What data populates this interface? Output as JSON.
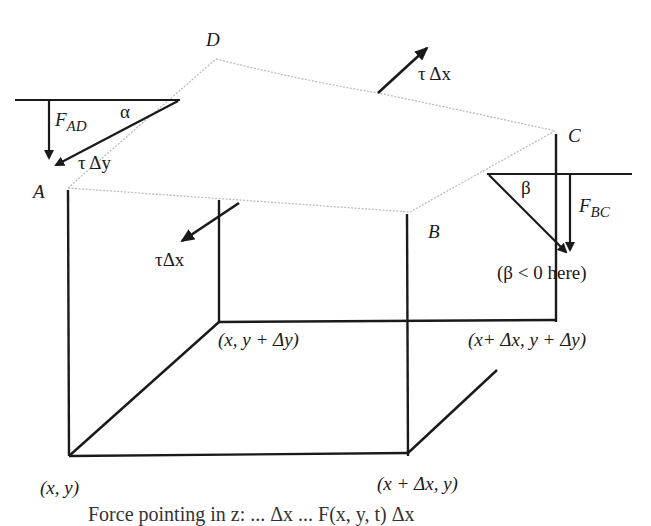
{
  "diagram": {
    "vertices": {
      "A": "A",
      "B": "B",
      "C": "C",
      "D": "D"
    },
    "base_corners": {
      "origin": "(x, y)",
      "x_plus": "(x + Δx, y)",
      "y_plus": "(x, y + Δy)",
      "xy_plus": "(x+ Δx, y + Δy)"
    },
    "forces": {
      "tau_dx_top": "τ Δx",
      "tau_dx_front": "τΔx",
      "tau_dy": "τ Δy",
      "F_AD_main": "F",
      "F_AD_sub": "AD",
      "F_BC_main": "F",
      "F_BC_sub": "BC"
    },
    "angles": {
      "alpha": "α",
      "beta": "β",
      "beta_note": "(β < 0 here)"
    },
    "caption": "Force pointing in z: ... Δx ... F(x, y, t) Δx",
    "colors": {
      "line": "#1a1a1a",
      "membrane": "#bdbdbd",
      "background": "#ffffff"
    }
  }
}
